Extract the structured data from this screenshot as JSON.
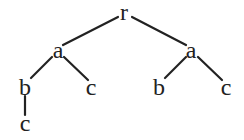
{
  "diagram": {
    "type": "tree",
    "nodes": [
      {
        "id": "n0",
        "label": "r",
        "x": 124,
        "y": 20
      },
      {
        "id": "n1",
        "label": "a",
        "x": 58,
        "y": 58
      },
      {
        "id": "n2",
        "label": "a",
        "x": 191,
        "y": 58
      },
      {
        "id": "n3",
        "label": "b",
        "x": 25,
        "y": 95
      },
      {
        "id": "n4",
        "label": "c",
        "x": 91,
        "y": 95
      },
      {
        "id": "n5",
        "label": "b",
        "x": 159,
        "y": 95
      },
      {
        "id": "n6",
        "label": "c",
        "x": 226,
        "y": 95
      },
      {
        "id": "n7",
        "label": "c",
        "x": 25,
        "y": 131
      }
    ],
    "edges": [
      {
        "from": "n0",
        "to": "n1",
        "x1": 118,
        "y1": 17,
        "x2": 63,
        "y2": 45
      },
      {
        "from": "n0",
        "to": "n2",
        "x1": 132,
        "y1": 17,
        "x2": 186,
        "y2": 45
      },
      {
        "from": "n1",
        "to": "n3",
        "x1": 52,
        "y1": 57,
        "x2": 31,
        "y2": 78
      },
      {
        "from": "n1",
        "to": "n4",
        "x1": 64,
        "y1": 57,
        "x2": 88,
        "y2": 80
      },
      {
        "from": "n2",
        "to": "n5",
        "x1": 186,
        "y1": 57,
        "x2": 165,
        "y2": 78
      },
      {
        "from": "n2",
        "to": "n6",
        "x1": 198,
        "y1": 57,
        "x2": 222,
        "y2": 80
      },
      {
        "from": "n3",
        "to": "n7",
        "x1": 25,
        "y1": 96,
        "x2": 25,
        "y2": 115
      }
    ],
    "colors": {
      "stroke": "#222222",
      "text": "#222222",
      "background": "#ffffff"
    }
  }
}
